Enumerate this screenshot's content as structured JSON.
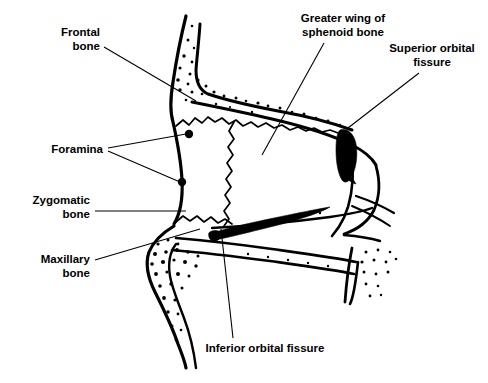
{
  "figure": {
    "background_color": "#ffffff",
    "ink_color": "#000000",
    "width": 488,
    "height": 383
  },
  "labels": [
    {
      "id": "frontal-bone",
      "line1": "Frontal",
      "line2": "bone",
      "align": "right",
      "text_x": 100,
      "text_y": 36,
      "leader": "M104,47 L196,101"
    },
    {
      "id": "greater-wing-of-sphenoid-bone",
      "line1": "Greater wing of",
      "line2": "sphenoid bone",
      "align": "center",
      "text_x": 343,
      "text_y": 22,
      "leader": "M324,43 L262,155"
    },
    {
      "id": "superior-orbital-fissure",
      "line1": "Superior orbital",
      "line2": "fissure",
      "align": "center",
      "text_x": 432,
      "text_y": 52,
      "leader": "M419,73 L348,128"
    },
    {
      "id": "foramina",
      "line1": "Foramina",
      "line2": "",
      "align": "right",
      "text_x": 103,
      "text_y": 152,
      "leader": "M108,148 L186,134",
      "leader2": "M108,151 L180,182"
    },
    {
      "id": "zygomatic-bone",
      "line1": "Zygomatic",
      "line2": "bone",
      "align": "right",
      "text_x": 90,
      "text_y": 201,
      "leader": "M95,211 L186,211"
    },
    {
      "id": "maxillary-bone",
      "line1": "Maxillary",
      "line2": "bone",
      "align": "right",
      "text_x": 90,
      "text_y": 260,
      "leader": "M95,260 L200,229"
    },
    {
      "id": "inferior-orbital-fissure",
      "line1": "Inferior orbital fissure",
      "line2": "",
      "align": "center",
      "text_x": 265,
      "text_y": 351,
      "leader": "M233,338 L221,229"
    }
  ],
  "structures": {
    "frontal_bone_note": "stippled superior-lateral orbital margin",
    "zygomatic_bone_note": "anterior lateral orbital wall",
    "maxillary_bone_note": "stippled inferior orbital rim",
    "sphenoid_note": "greater wing forming posterior lateral orbital wall",
    "superior_orbital_fissure_note": "solid black teardrop at posterior superior orbit",
    "inferior_orbital_fissure_note": "solid black tapering wedge along orbital floor",
    "foramina_count": 2
  }
}
